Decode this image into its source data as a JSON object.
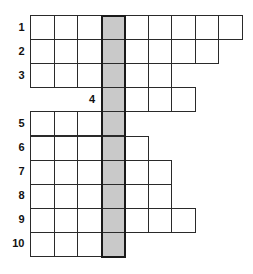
{
  "puzzle": {
    "type": "crossword-vertical-keyword",
    "shaded_column": 4,
    "shaded_color": "#c9c9c9",
    "rows": [
      {
        "number": "1",
        "start_col": 1,
        "end_col": 9
      },
      {
        "number": "2",
        "start_col": 1,
        "end_col": 8
      },
      {
        "number": "3",
        "start_col": 1,
        "end_col": 6
      },
      {
        "number": "4",
        "start_col": 4,
        "end_col": 7
      },
      {
        "number": "5",
        "start_col": 1,
        "end_col": 4
      },
      {
        "number": "6",
        "start_col": 1,
        "end_col": 5
      },
      {
        "number": "7",
        "start_col": 1,
        "end_col": 6
      },
      {
        "number": "8",
        "start_col": 1,
        "end_col": 6
      },
      {
        "number": "9",
        "start_col": 1,
        "end_col": 7
      },
      {
        "number": "10",
        "start_col": 1,
        "end_col": 4
      }
    ]
  }
}
